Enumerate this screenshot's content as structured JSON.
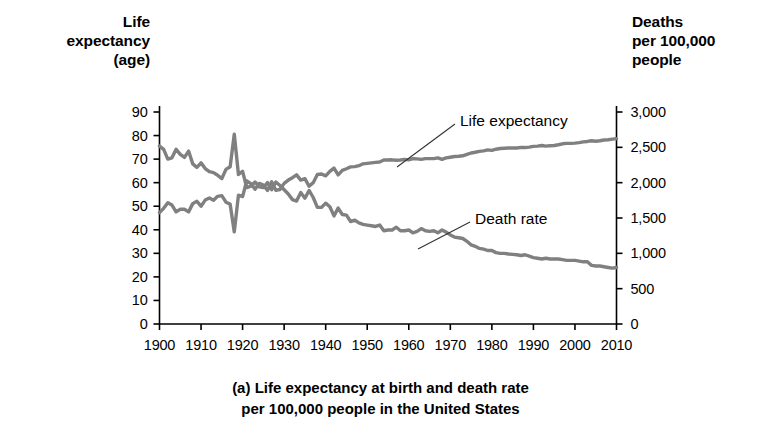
{
  "figure": {
    "caption": "(a) Life expectancy at birth and death rate\nper 100,000 people in the United States",
    "left_axis_header": "Life\nexpectancy\n(age)",
    "right_axis_header": "Deaths\nper 100,000\npeople",
    "line_color": "#808080",
    "axis_color": "#000000"
  },
  "chart_data": {
    "type": "line",
    "title": "(a) Life expectancy at birth and death rate per 100,000 people in the United States",
    "xlabel": "",
    "ylabel": "Life expectancy (age)",
    "y2label": "Deaths per 100,000 people",
    "xlim": [
      1900,
      2010
    ],
    "ylim": [
      0,
      90
    ],
    "y2lim": [
      0,
      3000
    ],
    "grid": false,
    "legend_position": "inline-annotations",
    "xticks": [
      "1900",
      "1910",
      "1920",
      "1930",
      "1940",
      "1950",
      "1960",
      "1970",
      "1980",
      "1990",
      "2000",
      "2010"
    ],
    "yticks": [
      "0",
      "10",
      "20",
      "30",
      "40",
      "50",
      "60",
      "70",
      "80",
      "90"
    ],
    "y2ticks": [
      "0",
      "500",
      "1,000",
      "1,500",
      "2,000",
      "2,500",
      "3,000"
    ],
    "annotations": [
      {
        "text": "Life expectancy",
        "x": 1958,
        "y": 62
      },
      {
        "text": "Death rate",
        "x": 1971,
        "y": 33
      }
    ],
    "series": [
      {
        "name": "Life expectancy",
        "axis": "left",
        "unit": "age",
        "x": [
          1900,
          1901,
          1902,
          1903,
          1904,
          1905,
          1906,
          1907,
          1908,
          1909,
          1910,
          1911,
          1912,
          1913,
          1914,
          1915,
          1916,
          1917,
          1918,
          1919,
          1920,
          1921,
          1922,
          1923,
          1924,
          1925,
          1926,
          1927,
          1928,
          1929,
          1930,
          1931,
          1932,
          1933,
          1934,
          1935,
          1936,
          1937,
          1938,
          1939,
          1940,
          1941,
          1942,
          1943,
          1944,
          1945,
          1946,
          1947,
          1948,
          1949,
          1950,
          1951,
          1952,
          1953,
          1954,
          1955,
          1956,
          1957,
          1958,
          1959,
          1960,
          1961,
          1962,
          1963,
          1964,
          1965,
          1966,
          1967,
          1968,
          1969,
          1970,
          1971,
          1972,
          1973,
          1974,
          1975,
          1976,
          1977,
          1978,
          1979,
          1980,
          1981,
          1982,
          1983,
          1984,
          1985,
          1986,
          1987,
          1988,
          1989,
          1990,
          1991,
          1992,
          1993,
          1994,
          1995,
          1996,
          1997,
          1998,
          1999,
          2000,
          2001,
          2002,
          2003,
          2004,
          2005,
          2006,
          2007,
          2008,
          2009,
          2010
        ],
        "values": [
          47.3,
          49.1,
          51.5,
          50.5,
          47.6,
          48.7,
          48.7,
          47.6,
          51.1,
          52.1,
          50.0,
          52.6,
          53.5,
          52.5,
          54.2,
          54.5,
          51.7,
          50.9,
          39.1,
          54.7,
          54.1,
          60.8,
          59.6,
          57.2,
          59.7,
          59.0,
          56.7,
          60.4,
          56.8,
          57.1,
          59.7,
          61.1,
          62.1,
          63.3,
          61.1,
          61.7,
          58.5,
          60.0,
          63.5,
          63.7,
          62.9,
          64.8,
          66.2,
          63.3,
          65.2,
          65.9,
          66.7,
          66.8,
          67.2,
          68.0,
          68.2,
          68.4,
          68.6,
          68.8,
          69.6,
          69.6,
          69.7,
          69.5,
          69.6,
          69.9,
          69.7,
          70.2,
          70.1,
          69.9,
          70.2,
          70.2,
          70.2,
          70.5,
          69.9,
          70.5,
          70.8,
          71.1,
          71.2,
          71.4,
          72.0,
          72.6,
          72.9,
          73.3,
          73.5,
          73.9,
          73.7,
          74.2,
          74.5,
          74.6,
          74.7,
          74.7,
          74.7,
          75.0,
          74.9,
          75.1,
          75.4,
          75.5,
          75.8,
          75.5,
          75.7,
          75.8,
          76.1,
          76.5,
          76.7,
          76.7,
          76.8,
          77.0,
          77.3,
          77.5,
          77.8,
          77.6,
          77.8,
          78.1,
          78.2,
          78.5,
          78.7
        ]
      },
      {
        "name": "Death rate",
        "axis": "right",
        "unit": "deaths per 100,000 people",
        "x": [
          1900,
          1901,
          1902,
          1903,
          1904,
          1905,
          1906,
          1907,
          1908,
          1909,
          1910,
          1911,
          1912,
          1913,
          1914,
          1915,
          1916,
          1917,
          1918,
          1919,
          1920,
          1921,
          1922,
          1923,
          1924,
          1925,
          1926,
          1927,
          1928,
          1929,
          1930,
          1931,
          1932,
          1933,
          1934,
          1935,
          1936,
          1937,
          1938,
          1939,
          1940,
          1941,
          1942,
          1943,
          1944,
          1945,
          1946,
          1947,
          1948,
          1949,
          1950,
          1951,
          1952,
          1953,
          1954,
          1955,
          1956,
          1957,
          1958,
          1959,
          1960,
          1961,
          1962,
          1963,
          1964,
          1965,
          1966,
          1967,
          1968,
          1969,
          1970,
          1971,
          1972,
          1973,
          1974,
          1975,
          1976,
          1977,
          1978,
          1979,
          1980,
          1981,
          1982,
          1983,
          1984,
          1985,
          1986,
          1987,
          1988,
          1989,
          1990,
          1991,
          1992,
          1993,
          1994,
          1995,
          1996,
          1997,
          1998,
          1999,
          2000,
          2001,
          2002,
          2003,
          2004,
          2005,
          2006,
          2007,
          2008,
          2009,
          2010
        ],
        "values": [
          2518,
          2471,
          2333,
          2351,
          2472,
          2400,
          2357,
          2447,
          2266,
          2217,
          2280,
          2200,
          2155,
          2142,
          2105,
          2058,
          2188,
          2226,
          2685,
          2116,
          2160,
          1930,
          1950,
          2010,
          1940,
          1930,
          2000,
          1900,
          2010,
          1960,
          1900,
          1840,
          1760,
          1740,
          1860,
          1780,
          1890,
          1790,
          1650,
          1650,
          1710,
          1660,
          1530,
          1640,
          1550,
          1540,
          1450,
          1470,
          1430,
          1410,
          1400,
          1390,
          1380,
          1400,
          1320,
          1330,
          1330,
          1370,
          1320,
          1320,
          1330,
          1290,
          1310,
          1350,
          1320,
          1310,
          1320,
          1290,
          1330,
          1300,
          1260,
          1230,
          1220,
          1210,
          1170,
          1120,
          1100,
          1070,
          1060,
          1040,
          1040,
          1010,
          1000,
          1000,
          990,
          985,
          980,
          970,
          980,
          960,
          940,
          930,
          920,
          930,
          920,
          920,
          920,
          910,
          900,
          900,
          900,
          890,
          880,
          880,
          830,
          820,
          820,
          810,
          800,
          790,
          800
        ]
      }
    ]
  }
}
